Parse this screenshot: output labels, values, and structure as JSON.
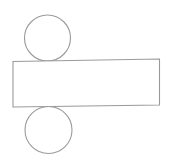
{
  "diagram": {
    "stroke_color": "#9a9a9a",
    "fill_color": "#ffffff",
    "stroke_width": 1.1,
    "shapes": {
      "top_circle": {
        "cx": 47.5,
        "cy": 38,
        "r": 23
      },
      "rectangle": {
        "points": "13,61.5 159.5,59 159.5,105 13,107"
      },
      "bottom_circle": {
        "cx": 48.5,
        "cy": 130,
        "r": 23.5
      }
    }
  }
}
